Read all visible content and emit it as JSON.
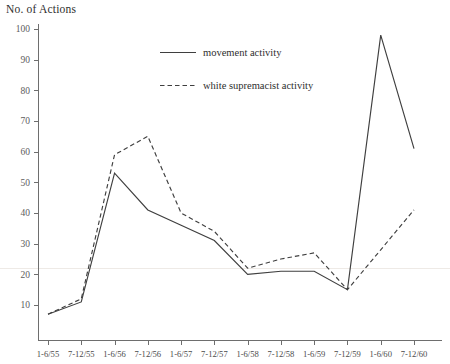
{
  "chart_data": {
    "type": "line",
    "title": "No. of Actions",
    "xlabel": "",
    "ylabel": "No. of Actions",
    "ylim": [
      0,
      100
    ],
    "ytick_labels": [
      "100",
      "90",
      "80",
      "70",
      "60",
      "50",
      "40",
      "30",
      "20",
      "10"
    ],
    "yticks": [
      100,
      90,
      80,
      70,
      60,
      50,
      40,
      30,
      20,
      10
    ],
    "grid": false,
    "legend_position": "upper-center",
    "categories": [
      "1-6/55",
      "7-12/55",
      "1-6/56",
      "7-12/56",
      "1-6/57",
      "7-12/57",
      "1-6/58",
      "7-12/58",
      "1-6/59",
      "7-12/59",
      "1-6/60",
      "7-12/60"
    ],
    "series": [
      {
        "name": "movement activity",
        "style": "solid",
        "color": "#3f3f3f",
        "values": [
          7,
          11,
          53,
          41,
          36,
          31,
          20,
          21,
          21,
          15,
          98,
          61
        ]
      },
      {
        "name": "white supremacist activity",
        "style": "dashed",
        "color": "#3f3f3f",
        "values": [
          7,
          12,
          59,
          65,
          40,
          34,
          22,
          25,
          27,
          15,
          28,
          41
        ]
      }
    ]
  },
  "legend": {
    "entries": [
      {
        "label": "movement activity",
        "style": "solid"
      },
      {
        "label": "white supremacist activity",
        "style": "dashed"
      }
    ]
  }
}
